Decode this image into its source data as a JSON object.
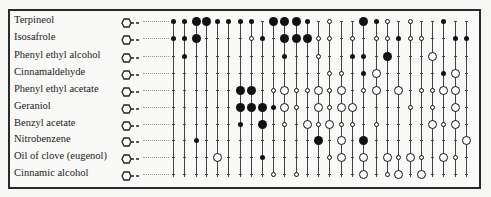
{
  "rows": [
    {
      "label": "Terpineol",
      "y": 21
    },
    {
      "label": "Isosafrole",
      "y": 38
    },
    {
      "label": "Phenyl ethyl alcohol",
      "y": 56
    },
    {
      "label": "Cinnamaldehyde",
      "y": 73
    },
    {
      "label": "Phenyl ethyl acetate",
      "y": 90
    },
    {
      "label": "Geraniol",
      "y": 107
    },
    {
      "label": "Benzyl acetate",
      "y": 124
    },
    {
      "label": "Nitrobenzene",
      "y": 140
    },
    {
      "label": "Oil of clove (eugenol)",
      "y": 157
    },
    {
      "label": "Cinnamic alcohol",
      "y": 174
    }
  ],
  "columns_x": [
    173,
    184,
    196,
    206,
    217,
    228,
    240,
    251,
    262,
    273,
    284,
    296,
    307,
    318,
    329,
    341,
    352,
    363,
    376,
    387,
    398,
    410,
    421,
    432,
    443,
    455,
    466
  ],
  "legend": {
    "F": "large filled",
    "f": "small filled",
    "O": "large open",
    "o": "small open",
    ".": "tick (absent)"
  },
  "matrix": [
    "ffFFffff.FFFf.o..Ffo.o..f..",
    "ffF....of.FFFoo.o.oofoo..ff.",
    ".f........f..o..ff.F...O....",
    "..............oo.fO.....fO...",
    "......FF.oOooOoO.oO.O.ooOO...",
    "......FFFfOo.OoOO....o.o.O...",
    "......f.F.o.OoOoo.o....OoO...",
    "..f..........F.O.F........O.",
    "....O...f.....oO.O.OoOo.Oo..",
    ".........o.o.....O.oO.O......"
  ]
}
